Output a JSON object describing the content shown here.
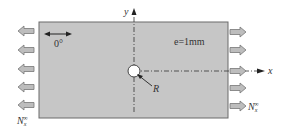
{
  "diagram": {
    "plate": {
      "fill": "#c8c8c8",
      "stroke": "#666666"
    },
    "hole": {
      "label": "R"
    },
    "axes": {
      "x_label": "x",
      "y_label": "y"
    },
    "fiber_direction": {
      "label": "0°"
    },
    "thickness": {
      "label": "e=1mm"
    },
    "load": {
      "symbol": "N",
      "subscript": "x",
      "superscript": "∞",
      "left_arrows": 5,
      "right_arrows": 5,
      "arrow_fill": "#b8b8b8"
    }
  }
}
